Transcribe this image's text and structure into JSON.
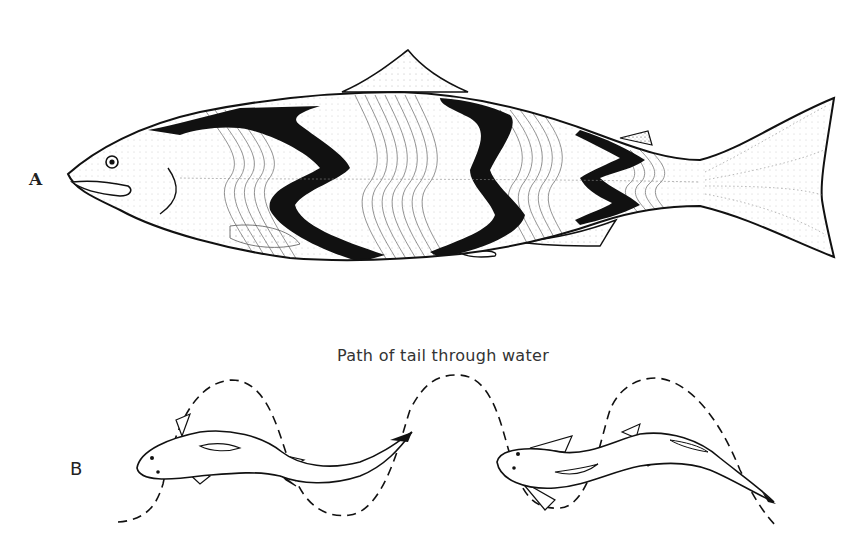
{
  "figure": {
    "panel_a": {
      "label": "A",
      "subject": "salmon-side-view-with-myomere-bands"
    },
    "panel_b": {
      "label": "B",
      "caption": "Path of tail through water",
      "subject": "two-swimming-fish-top-view-with-dashed-tail-path"
    },
    "colors": {
      "ink": "#111111",
      "background": "#ffffff",
      "stipple": "#555555"
    }
  }
}
